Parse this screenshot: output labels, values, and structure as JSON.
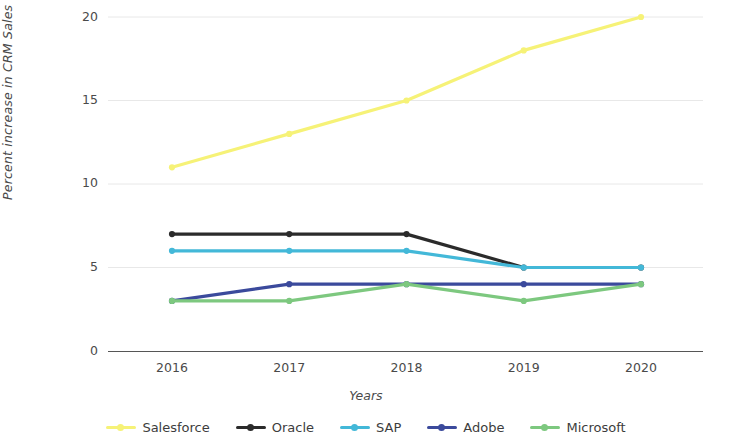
{
  "chart_data": {
    "type": "line",
    "title": "",
    "xlabel": "Years",
    "ylabel": "Percent increase in CRM Sales",
    "categories": [
      "2016",
      "2017",
      "2018",
      "2019",
      "2020"
    ],
    "x": [
      2016,
      2017,
      2018,
      2019,
      2020
    ],
    "ylim": [
      0,
      20
    ],
    "yticks": [
      0,
      5,
      10,
      15,
      20
    ],
    "ytick_labels": [
      "0",
      "5",
      "10",
      "15",
      "20"
    ],
    "grid": "horizontal-faint",
    "legend_position": "bottom",
    "markers": true,
    "series": [
      {
        "name": "Salesforce",
        "color": "#f6f277",
        "values": [
          11,
          13,
          15,
          18,
          20
        ]
      },
      {
        "name": "Oracle",
        "color": "#2b2b2b",
        "values": [
          7,
          7,
          7,
          5,
          5
        ]
      },
      {
        "name": "SAP",
        "color": "#43b8d8",
        "values": [
          6,
          6,
          6,
          5,
          5
        ]
      },
      {
        "name": "Adobe",
        "color": "#3b4a9c",
        "values": [
          3,
          4,
          4,
          4,
          4
        ]
      },
      {
        "name": "Microsoft",
        "color": "#7dc87f",
        "values": [
          3,
          3,
          4,
          3,
          4
        ]
      }
    ]
  },
  "axis": {
    "y_title": "Percent increase in CRM Sales",
    "x_title": "Years",
    "y_tick_labels": [
      "20",
      "15",
      "10",
      "5",
      "0"
    ],
    "x_tick_labels": [
      "2016",
      "2017",
      "2018",
      "2019",
      "2020"
    ]
  },
  "legend": {
    "items": [
      {
        "label": "Salesforce",
        "color": "#f6f277"
      },
      {
        "label": "Oracle",
        "color": "#2b2b2b"
      },
      {
        "label": "SAP",
        "color": "#43b8d8"
      },
      {
        "label": "Adobe",
        "color": "#3b4a9c"
      },
      {
        "label": "Microsoft",
        "color": "#7dc87f"
      }
    ]
  },
  "colors": {
    "axis": "#565656",
    "grid": "#e8e8e8",
    "text": "#4a4a4a",
    "background": "#ffffff"
  }
}
